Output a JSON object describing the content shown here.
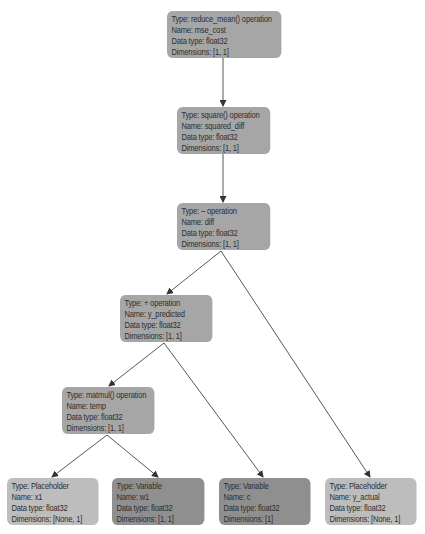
{
  "diagram": {
    "type": "computation-graph",
    "colors": {
      "operation": "#a6a6a6",
      "placeholder": "#bdbdbd",
      "variable": "#8f8f8f",
      "edge": "#444444"
    },
    "nodes": [
      {
        "id": "mse_cost",
        "kind": "operation",
        "type_line": "Type: reduce_mean() operation",
        "name_line": "Name: mse_cost",
        "dtype_line": "Data type: float32",
        "dims_line": "Dimensions: [1, 1]"
      },
      {
        "id": "squared_diff",
        "kind": "operation",
        "type_line": "Type: square() operation",
        "name_line": "Name: squared_diff",
        "dtype_line": "Data type: float32",
        "dims_line": "Dimensions: [1, 1]"
      },
      {
        "id": "diff",
        "kind": "operation",
        "type_line": "Type: – operation",
        "name_line": "Name: diff",
        "dtype_line": "Data type: float32",
        "dims_line": "Dimensions: [1, 1]"
      },
      {
        "id": "y_predicted",
        "kind": "operation",
        "type_line": "Type: + operation",
        "name_line": "Name: y_predicted",
        "dtype_line": "Data type: float32",
        "dims_line": "Dimensions: [1, 1]"
      },
      {
        "id": "temp",
        "kind": "operation",
        "type_line": "Type: matmul() operation",
        "name_line": "Name: temp",
        "dtype_line": "Data type: float32",
        "dims_line": "Dimensions: [1, 1]"
      },
      {
        "id": "x1",
        "kind": "placeholder",
        "type_line": "Type: Placeholder",
        "name_line": "Name: x1",
        "dtype_line": "Data type: float32",
        "dims_line": "Dimensions: [None, 1]"
      },
      {
        "id": "w1",
        "kind": "variable",
        "type_line": "Type: Variable",
        "name_line": "Name: w1",
        "dtype_line": "Data type: float32",
        "dims_line": "Dimensions: [1, 1]"
      },
      {
        "id": "c",
        "kind": "variable",
        "type_line": "Type: Variable",
        "name_line": "Name: c",
        "dtype_line": "Data type: float32",
        "dims_line": "Dimensions: [1]"
      },
      {
        "id": "y_actual",
        "kind": "placeholder",
        "type_line": "Type: Placeholder",
        "name_line": "Name: y_actual",
        "dtype_line": "Data type: float32",
        "dims_line": "Dimensions: [None, 1]"
      }
    ],
    "edges": [
      {
        "from": "mse_cost",
        "to": "squared_diff"
      },
      {
        "from": "squared_diff",
        "to": "diff"
      },
      {
        "from": "diff",
        "to": "y_predicted"
      },
      {
        "from": "diff",
        "to": "y_actual"
      },
      {
        "from": "y_predicted",
        "to": "temp"
      },
      {
        "from": "y_predicted",
        "to": "c"
      },
      {
        "from": "temp",
        "to": "x1"
      },
      {
        "from": "temp",
        "to": "w1"
      }
    ]
  }
}
